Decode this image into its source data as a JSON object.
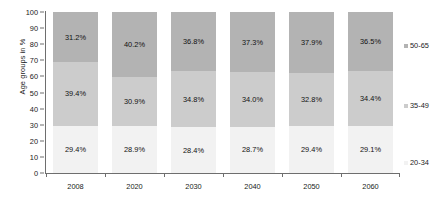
{
  "chart_data": {
    "type": "bar",
    "subtype": "stacked-100",
    "title": "",
    "xlabel": "",
    "ylabel": "Age groups in %",
    "ylim": [
      0,
      100
    ],
    "yticks": [
      0,
      10,
      20,
      30,
      40,
      50,
      60,
      70,
      80,
      90,
      100
    ],
    "grid": false,
    "legend_position": "right",
    "categories": [
      "2008",
      "2020",
      "2030",
      "2040",
      "2050",
      "2060"
    ],
    "series": [
      {
        "name": "20-34",
        "color": "#f2f2f2",
        "values": [
          29.4,
          28.9,
          28.4,
          28.7,
          29.4,
          29.1
        ],
        "labels": [
          "29.4%",
          "28.9%",
          "28.4%",
          "28.7%",
          "29.4%",
          "29.1%"
        ]
      },
      {
        "name": "35-49",
        "color": "#cccccc",
        "values": [
          39.4,
          30.9,
          34.8,
          34.0,
          32.8,
          34.4
        ],
        "labels": [
          "39.4%",
          "30.9%",
          "34.8%",
          "34.0%",
          "32.8%",
          "34.4%"
        ]
      },
      {
        "name": "50-65",
        "color": "#b3b3b3",
        "values": [
          31.2,
          40.2,
          36.8,
          37.3,
          37.9,
          36.5
        ],
        "labels": [
          "31.2%",
          "40.2%",
          "36.8%",
          "37.3%",
          "37.9%",
          "36.5%"
        ]
      }
    ]
  },
  "axis": {
    "y_title": "Age groups in %",
    "y_tick_labels": [
      "100",
      "90",
      "80",
      "70",
      "60",
      "50",
      "40",
      "30",
      "20",
      "10",
      "0"
    ],
    "x_tick_labels": [
      "2008",
      "2020",
      "2030",
      "2040",
      "2050",
      "2060"
    ]
  },
  "legend": {
    "items": [
      {
        "label": "50-65",
        "color": "#b3b3b3"
      },
      {
        "label": "35-49",
        "color": "#cccccc"
      },
      {
        "label": "20-34",
        "color": "#f2f2f2"
      }
    ]
  },
  "colors": {
    "axis": "#6e6e6e",
    "text": "#1a1a1a",
    "background": "#ffffff"
  }
}
